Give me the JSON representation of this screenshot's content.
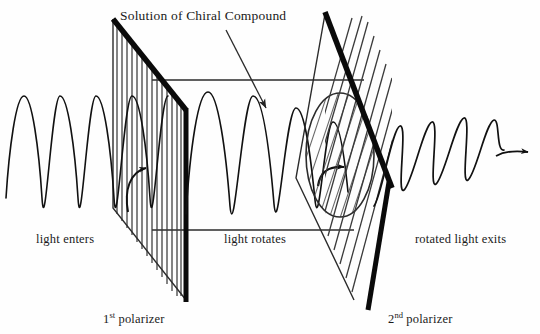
{
  "figure": {
    "kind": "optical-rotation-polarimeter-diagram",
    "background_color": "#fefefe",
    "ink_color": "#111111",
    "title": "Solution of Chiral Compound"
  },
  "labels": {
    "title": "Solution of Chiral Compound",
    "light_enters": "light enters",
    "light_rotates": "light rotates",
    "rotated_light_exits": "rotated light exits",
    "first_polarizer": "1",
    "first_polarizer_sup": "st",
    "first_polarizer_rest": " polarizer",
    "second_polarizer": "2",
    "second_polarizer_sup": "nd",
    "second_polarizer_rest": " polarizer"
  },
  "components": {
    "polarizer_one": {
      "name": "1st polarizer",
      "grating_orientation": "vertical",
      "grating_line_count": 16,
      "frame_color": "#0a0a0a"
    },
    "polarizer_two": {
      "name": "2nd polarizer",
      "grating_orientation": "slanted",
      "grating_line_count": 13,
      "frame_color": "#0a0a0a"
    },
    "sample_tube": {
      "name": "solution of chiral compound",
      "shape": "cylinder",
      "end_cap": "ellipse",
      "fill": "hatched"
    },
    "incoming_wave": {
      "description": "plane polarized light wave entering",
      "orientation": "vertical plane",
      "cycles": 5
    },
    "inside_wave": {
      "description": "wave rotating through the solution",
      "orientation": "progressively rotating",
      "cycles": 5
    },
    "exit_wave": {
      "description": "rotated plane polarized light exiting",
      "orientation": "tilted plane",
      "cycles": 5,
      "arrow": "right"
    }
  }
}
